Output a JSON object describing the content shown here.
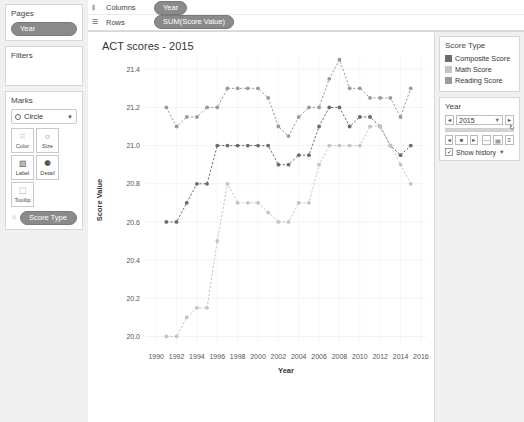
{
  "shelves": {
    "pages": {
      "title": "Pages",
      "pill": "Year"
    },
    "filters": {
      "title": "Filters"
    },
    "columns": {
      "label": "Columns",
      "pill": "Year",
      "icon": "columns-icon"
    },
    "rows": {
      "label": "Rows",
      "pill": "SUM(Score Value)",
      "icon": "rows-icon"
    }
  },
  "marks": {
    "title": "Marks",
    "type": "Circle",
    "buttons": [
      {
        "name": "color",
        "label": "Color",
        "glyph": "⁙"
      },
      {
        "name": "size",
        "label": "Size",
        "glyph": "○"
      },
      {
        "name": "label",
        "label": "Label",
        "glyph": "▧"
      },
      {
        "name": "detail",
        "label": "Detail",
        "glyph": "⚈"
      },
      {
        "name": "tooltip",
        "label": "Tooltip",
        "glyph": "⬚"
      }
    ],
    "encoding_pill": "Score Type"
  },
  "view": {
    "title": "ACT scores - 2015"
  },
  "legend": {
    "title": "Score Type",
    "items": [
      {
        "label": "Composite Score",
        "color": "#6b6b6b"
      },
      {
        "label": "Math Score",
        "color": "#c4c4c4"
      },
      {
        "label": "Reading Score",
        "color": "#9a9a9a"
      }
    ]
  },
  "year_filter": {
    "title": "Year",
    "value": "2015",
    "prev": "◄",
    "next": "►",
    "reset_glyph": "↻",
    "play_back": "◄",
    "play_stop": "■",
    "play_forward": "►",
    "speed_slow": "—",
    "speed_med": "▤",
    "speed_fast": "≡",
    "show_history_label": "Show history",
    "show_history_checked": "✓"
  },
  "chart_data": {
    "type": "line",
    "title": "ACT scores - 2015",
    "xlabel": "Year",
    "ylabel": "Score Value",
    "xlim": [
      1989,
      2016.5
    ],
    "ylim": [
      19.95,
      21.48
    ],
    "xticks": [
      1990,
      1992,
      1994,
      1996,
      1998,
      2000,
      2002,
      2004,
      2006,
      2008,
      2010,
      2012,
      2014,
      2016
    ],
    "yticks": [
      20.0,
      20.2,
      20.4,
      20.6,
      20.8,
      21.0,
      21.2,
      21.4
    ],
    "grid": true,
    "legend_position": "right",
    "marker": "circle",
    "linestyle": "dashed",
    "x": [
      1991,
      1992,
      1993,
      1994,
      1995,
      1996,
      1997,
      1998,
      1999,
      2000,
      2001,
      2002,
      2003,
      2004,
      2005,
      2006,
      2007,
      2008,
      2009,
      2010,
      2011,
      2012,
      2013,
      2014,
      2015
    ],
    "series": [
      {
        "name": "Reading Score",
        "color": "#9a9a9a",
        "values": [
          21.2,
          21.1,
          21.15,
          21.15,
          21.2,
          21.2,
          21.3,
          21.3,
          21.3,
          21.3,
          21.25,
          21.1,
          21.05,
          21.15,
          21.2,
          21.2,
          21.35,
          21.45,
          21.3,
          21.3,
          21.25,
          21.25,
          21.25,
          21.15,
          21.3
        ],
        "last_value": 21.35
      },
      {
        "name": "Composite Score",
        "color": "#6b6b6b",
        "values": [
          20.6,
          20.6,
          20.7,
          20.8,
          20.8,
          21.0,
          21.0,
          21.0,
          21.0,
          21.0,
          21.0,
          20.9,
          20.9,
          20.95,
          20.95,
          21.1,
          21.2,
          21.2,
          21.1,
          21.15,
          21.15,
          21.1,
          21.0,
          20.95,
          21.0
        ],
        "last_value": 21.0
      },
      {
        "name": "Math Score",
        "color": "#c4c4c4",
        "values": [
          20.0,
          20.0,
          20.1,
          20.15,
          20.15,
          20.5,
          20.8,
          20.7,
          20.7,
          20.7,
          20.65,
          20.6,
          20.6,
          20.7,
          20.7,
          20.9,
          21.0,
          21.0,
          21.0,
          21.0,
          21.1,
          21.1,
          21.0,
          20.9,
          20.8
        ],
        "last_value": 20.8
      }
    ]
  }
}
